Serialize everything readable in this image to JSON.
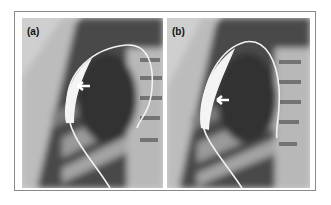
{
  "figure": {
    "panels": [
      {
        "label": "(a)",
        "annotation": "white arrow pointing left at catheter balloon"
      },
      {
        "label": "(b)",
        "annotation": "white arrow pointing left at catheter balloon"
      }
    ]
  },
  "colors": {
    "background": "#ffffff",
    "frame_border": "#8a8a8a",
    "xray_dark": "#3a3a3a",
    "xray_light": "#d9d9d9",
    "catheter": "#f4f4f4"
  }
}
